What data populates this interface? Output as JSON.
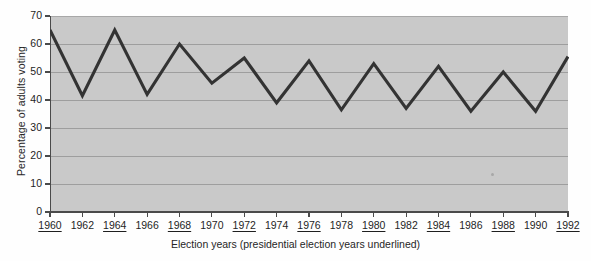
{
  "chart_data": {
    "type": "line",
    "title": "",
    "xlabel": "Election years (presidential election years underlined)",
    "ylabel": "Percentage of adults voting",
    "xlim": [
      1960,
      1992
    ],
    "ylim": [
      0,
      70
    ],
    "ytick_step": 10,
    "grid": true,
    "legend": "none",
    "line_color": "#333333",
    "plot_background": "#c9c9c9",
    "gridline_color": "#9e9e9e",
    "axis_color": "#4a4a4a",
    "yticks": [
      "0",
      "10",
      "20",
      "30",
      "40",
      "50",
      "60",
      "70"
    ],
    "categories": [
      "1960",
      "1962",
      "1964",
      "1966",
      "1968",
      "1970",
      "1972",
      "1974",
      "1976",
      "1978",
      "1980",
      "1982",
      "1984",
      "1986",
      "1988",
      "1990",
      "1992"
    ],
    "presidential_years": [
      "1960",
      "1964",
      "1968",
      "1972",
      "1976",
      "1980",
      "1984",
      "1988",
      "1992"
    ],
    "values": [
      65,
      41.5,
      65,
      42,
      60,
      46,
      55,
      39,
      54,
      36.5,
      53,
      37,
      52,
      36,
      50,
      36,
      55.5
    ],
    "series": [
      {
        "name": "Percentage of adults voting",
        "values": [
          65,
          41.5,
          65,
          42,
          60,
          46,
          55,
          39,
          54,
          36.5,
          53,
          37,
          52,
          36,
          50,
          36,
          55.5
        ]
      }
    ]
  }
}
